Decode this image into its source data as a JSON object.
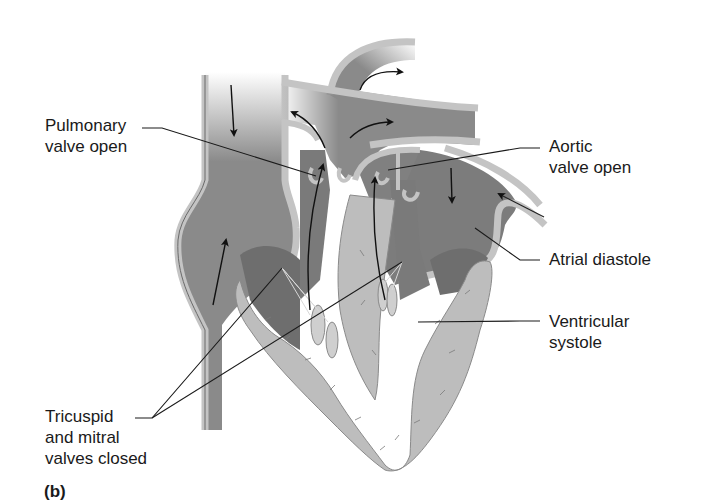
{
  "figure": {
    "panel_label": "(b)",
    "colors": {
      "background": "#ffffff",
      "chamber_dark": "#7a7a7a",
      "chamber_mid": "#8c8c8c",
      "vessel_wall": "#c4c4c4",
      "myocardium": "#bdbdbd",
      "leader_line": "#1a1a1a",
      "label_text": "#1a1a1a"
    }
  },
  "labels": {
    "pulmonary_valve": {
      "line1": "Pulmonary",
      "line2": "valve open"
    },
    "aortic_valve": {
      "line1": "Aortic",
      "line2": "valve open"
    },
    "atrial_diastole": {
      "line1": "Atrial diastole"
    },
    "ventricular_systole": {
      "line1": "Ventricular",
      "line2": "systole"
    },
    "av_valves": {
      "line1": "Tricuspid",
      "line2": "and mitral",
      "line3": "valves closed"
    }
  }
}
